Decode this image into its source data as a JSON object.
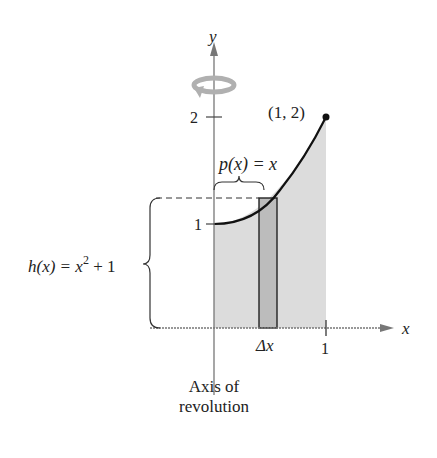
{
  "diagram": {
    "axes": {
      "x_label": "x",
      "y_label": "y"
    },
    "ticks": {
      "y1": "1",
      "y2": "2",
      "x1": "1"
    },
    "point_label": "(1, 2)",
    "p_label": "p(x) = x",
    "h_label_prefix": "h(x) = x",
    "h_label_exp": "2",
    "h_label_suffix": " + 1",
    "dx_label": "Δx",
    "axis_caption_line1": "Axis of",
    "axis_caption_line2": "revolution",
    "colors": {
      "fill": "#d9d9d9",
      "rect": "#bdbdbd",
      "curve": "#111111",
      "arrow": "#aaaaaa"
    }
  }
}
